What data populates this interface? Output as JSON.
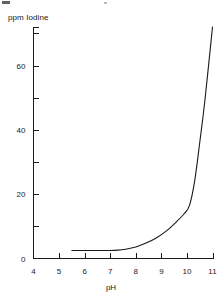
{
  "chart_data": {
    "type": "line",
    "title": "",
    "xlabel": "pH",
    "ylabel": "ppm Iodine",
    "xlim": [
      4,
      11
    ],
    "ylim": [
      0,
      72
    ],
    "grid": false,
    "legend": null,
    "x_ticks": [
      "4",
      "5",
      "6",
      "7",
      "8",
      "9",
      "10",
      "11"
    ],
    "x_tick_values": [
      4,
      5,
      6,
      7,
      8,
      9,
      10,
      11
    ],
    "y_ticks": [
      "0",
      "20",
      "40",
      "60"
    ],
    "y_tick_values": [
      0,
      20,
      40,
      60
    ],
    "y_minor_tick_values": [
      10,
      30,
      50,
      70
    ],
    "series": [
      {
        "name": "ppm Iodine",
        "x": [
          5.5,
          6.0,
          6.5,
          7.0,
          7.3,
          7.6,
          8.0,
          8.4,
          8.8,
          9.2,
          9.6,
          9.9,
          10.1,
          10.3,
          10.5,
          10.7,
          11.0
        ],
        "values": [
          2.5,
          2.5,
          2.5,
          2.5,
          2.6,
          2.9,
          3.6,
          4.8,
          6.4,
          8.6,
          11.5,
          14.0,
          16.5,
          24.0,
          36.0,
          49.0,
          72.0
        ]
      }
    ]
  },
  "figure": {
    "y_axis_title": "ppm Iodine",
    "x_axis_title": "pH"
  }
}
